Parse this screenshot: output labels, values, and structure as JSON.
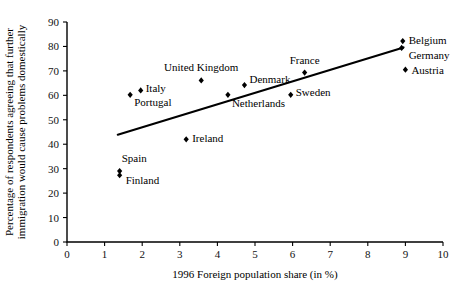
{
  "chart_data": {
    "type": "scatter",
    "title": "",
    "xlabel": "1996 Foreign population share (in %)",
    "ylabel": "Percentage of respondents agreeing that further immigration would cause problems domestically",
    "ylabel_line1": "Percentage of respondents agreeing that further",
    "ylabel_line2": "immigration would cause problems domestically",
    "xlim": [
      0,
      10
    ],
    "ylim": [
      0,
      90
    ],
    "xticks": [
      0,
      1,
      2,
      3,
      4,
      5,
      6,
      7,
      8,
      9,
      10
    ],
    "yticks": [
      0,
      10,
      20,
      30,
      40,
      50,
      60,
      70,
      80,
      90
    ],
    "xtick_labels": [
      "0",
      "1",
      "2",
      "3",
      "4",
      "5",
      "6",
      "7",
      "8",
      "9",
      "10"
    ],
    "ytick_labels": [
      "0",
      "10",
      "20",
      "30",
      "40",
      "50",
      "60",
      "70",
      "80",
      "90"
    ],
    "grid": false,
    "legend": "none",
    "marker_color": "#000000",
    "line_color": "#000000",
    "points": [
      {
        "label": "Spain",
        "x": 1.4,
        "y": 29.0,
        "label_dx": 2,
        "label_dy": -9,
        "anchor": "start"
      },
      {
        "label": "Finland",
        "x": 1.4,
        "y": 27.3,
        "label_dx": 6,
        "label_dy": 9,
        "anchor": "start"
      },
      {
        "label": "Portugal",
        "x": 1.68,
        "y": 60.2,
        "label_dx": 4,
        "label_dy": 11,
        "anchor": "start"
      },
      {
        "label": "Italy",
        "x": 1.96,
        "y": 62.0,
        "label_dx": 5,
        "label_dy": 2,
        "anchor": "start"
      },
      {
        "label": "Ireland",
        "x": 3.17,
        "y": 42.0,
        "label_dx": 6,
        "label_dy": 3,
        "anchor": "start"
      },
      {
        "label": "United Kingdom",
        "x": 3.57,
        "y": 66.1,
        "label_dx": 0,
        "label_dy": -9,
        "anchor": "middle"
      },
      {
        "label": "Netherlands",
        "x": 4.28,
        "y": 60.2,
        "label_dx": 4,
        "label_dy": 12,
        "anchor": "start"
      },
      {
        "label": "Denmark",
        "x": 4.72,
        "y": 64.2,
        "label_dx": 5,
        "label_dy": -2,
        "anchor": "start"
      },
      {
        "label": "Sweden",
        "x": 5.95,
        "y": 60.2,
        "label_dx": 5,
        "label_dy": 1,
        "anchor": "start"
      },
      {
        "label": "France",
        "x": 6.32,
        "y": 69.3,
        "label_dx": 0,
        "label_dy": -9,
        "anchor": "middle"
      },
      {
        "label": "Belgium",
        "x": 8.93,
        "y": 82.2,
        "label_dx": 6,
        "label_dy": 3,
        "anchor": "start"
      },
      {
        "label": "Germany",
        "x": 8.9,
        "y": 79.4,
        "label_dx": 7,
        "label_dy": 11,
        "anchor": "start"
      },
      {
        "label": "Austria",
        "x": 9.0,
        "y": 70.5,
        "label_dx": 6,
        "label_dy": 4,
        "anchor": "start"
      }
    ],
    "trend_line": {
      "x0": 1.35,
      "y0": 43.9,
      "x1": 8.95,
      "y1": 79.6
    }
  }
}
